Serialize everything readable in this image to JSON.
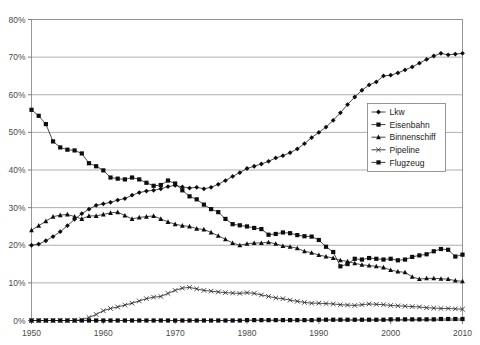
{
  "chart_data": {
    "type": "line",
    "title": "",
    "subtitle": "",
    "xlabel": "",
    "ylabel": "",
    "xlim": [
      1950,
      2010
    ],
    "ylim": [
      0,
      80
    ],
    "grid": true,
    "legend_position": "center-right",
    "x_ticks": [
      "1950",
      "1960",
      "1970",
      "1980",
      "1990",
      "2000",
      "2010"
    ],
    "x_tick_values": [
      1950,
      1960,
      1970,
      1980,
      1990,
      2000,
      2010
    ],
    "y_ticks": [
      "0%",
      "10%",
      "20%",
      "30%",
      "40%",
      "50%",
      "60%",
      "70%",
      "80%"
    ],
    "y_tick_values": [
      0,
      10,
      20,
      30,
      40,
      50,
      60,
      70,
      80
    ],
    "x": [
      1950,
      1951,
      1952,
      1953,
      1954,
      1955,
      1956,
      1957,
      1958,
      1959,
      1960,
      1961,
      1962,
      1963,
      1964,
      1965,
      1966,
      1967,
      1968,
      1969,
      1970,
      1971,
      1972,
      1973,
      1974,
      1975,
      1976,
      1977,
      1978,
      1979,
      1980,
      1981,
      1982,
      1983,
      1984,
      1985,
      1986,
      1987,
      1988,
      1989,
      1990,
      1991,
      1992,
      1993,
      1994,
      1995,
      1996,
      1997,
      1998,
      1999,
      2000,
      2001,
      2002,
      2003,
      2004,
      2005,
      2006,
      2007,
      2008,
      2009,
      2010
    ],
    "series": [
      {
        "name": "Lkw",
        "marker": "diamond",
        "values": [
          20.0,
          20.3,
          21.2,
          22.3,
          23.6,
          25.2,
          26.9,
          28.4,
          29.6,
          30.6,
          31.0,
          31.4,
          32.0,
          32.4,
          33.3,
          34.0,
          34.4,
          34.6,
          35.0,
          35.6,
          35.9,
          35.5,
          35.2,
          35.4,
          35.0,
          35.4,
          36.2,
          37.2,
          38.3,
          39.3,
          40.4,
          41.0,
          41.6,
          42.3,
          43.2,
          43.8,
          44.6,
          45.6,
          47.0,
          48.6,
          50.0,
          51.4,
          53.2,
          55.2,
          57.4,
          59.4,
          61.2,
          62.6,
          63.4,
          65.0,
          65.2,
          65.8,
          66.6,
          67.4,
          68.4,
          69.4,
          70.3,
          71.0,
          70.6,
          70.8,
          71.0
        ]
      },
      {
        "name": "Eisenbahn",
        "marker": "square",
        "values": [
          56.0,
          54.4,
          52.2,
          47.6,
          46.0,
          45.4,
          45.2,
          44.4,
          41.8,
          41.0,
          39.9,
          38.0,
          37.7,
          37.5,
          38.0,
          37.5,
          36.6,
          35.8,
          36.0,
          37.2,
          36.4,
          34.6,
          33.0,
          32.2,
          30.8,
          29.6,
          28.8,
          27.0,
          25.6,
          25.3,
          25.0,
          24.6,
          24.3,
          22.8,
          23.0,
          23.4,
          23.2,
          22.7,
          22.4,
          22.3,
          21.4,
          19.6,
          18.2,
          14.4,
          15.0,
          16.4,
          16.2,
          16.6,
          16.4,
          16.2,
          16.4,
          16.0,
          16.2,
          16.9,
          17.3,
          17.6,
          18.4,
          19.0,
          18.8,
          17.0,
          17.5
        ]
      },
      {
        "name": "Binnenschiff",
        "marker": "triangle",
        "values": [
          24.0,
          25.2,
          26.4,
          27.6,
          28.0,
          28.2,
          27.6,
          27.0,
          27.8,
          27.8,
          28.2,
          28.6,
          28.8,
          27.9,
          27.0,
          27.4,
          27.6,
          27.8,
          27.0,
          26.2,
          25.6,
          25.2,
          25.0,
          24.4,
          24.2,
          23.4,
          22.5,
          21.6,
          20.6,
          20.0,
          20.4,
          20.6,
          20.6,
          20.8,
          20.4,
          19.8,
          19.6,
          19.2,
          18.4,
          18.0,
          17.4,
          17.0,
          16.6,
          16.0,
          15.7,
          15.2,
          14.8,
          14.6,
          14.4,
          14.1,
          13.4,
          13.0,
          12.8,
          11.6,
          11.0,
          11.2,
          11.2,
          11.1,
          11.0,
          10.6,
          10.4
        ]
      },
      {
        "name": "Pipeline",
        "marker": "cross",
        "values": [
          0.0,
          0.0,
          0.0,
          0.0,
          0.0,
          0.0,
          0.0,
          0.2,
          0.8,
          1.6,
          2.6,
          3.2,
          3.6,
          4.1,
          4.6,
          5.2,
          5.8,
          6.2,
          6.4,
          7.2,
          8.0,
          8.6,
          8.8,
          8.4,
          8.0,
          7.8,
          7.6,
          7.4,
          7.3,
          7.2,
          7.4,
          7.2,
          6.8,
          6.4,
          6.0,
          5.8,
          5.4,
          5.1,
          4.8,
          4.6,
          4.6,
          4.5,
          4.4,
          4.2,
          4.1,
          4.0,
          4.2,
          4.4,
          4.3,
          4.2,
          4.0,
          3.9,
          3.8,
          3.7,
          3.6,
          3.4,
          3.3,
          3.2,
          3.2,
          3.1,
          3.0
        ]
      },
      {
        "name": "Flugzeug",
        "marker": "square",
        "values": [
          0.0,
          0.0,
          0.0,
          0.0,
          0.0,
          0.0,
          0.0,
          0.0,
          0.0,
          0.0,
          0.0,
          0.0,
          0.0,
          0.0,
          0.0,
          0.0,
          0.0,
          0.0,
          0.0,
          0.0,
          0.0,
          0.0,
          0.0,
          0.0,
          0.0,
          0.0,
          0.0,
          0.0,
          0.0,
          0.0,
          0.1,
          0.1,
          0.1,
          0.1,
          0.1,
          0.1,
          0.1,
          0.1,
          0.1,
          0.1,
          0.2,
          0.2,
          0.2,
          0.2,
          0.2,
          0.2,
          0.2,
          0.2,
          0.2,
          0.2,
          0.3,
          0.3,
          0.3,
          0.3,
          0.3,
          0.3,
          0.3,
          0.4,
          0.4,
          0.4,
          0.4
        ]
      }
    ]
  },
  "legend": {
    "entries": [
      {
        "label": "Lkw"
      },
      {
        "label": "Eisenbahn"
      },
      {
        "label": "Binnenschiff"
      },
      {
        "label": "Pipeline"
      },
      {
        "label": "Flugzeug"
      }
    ]
  },
  "colors": {
    "series": "#111111",
    "grid": "#9a9a9a",
    "frame": "#8d8d8d",
    "tick_text": "#4a4a4a",
    "background": "#ffffff"
  }
}
